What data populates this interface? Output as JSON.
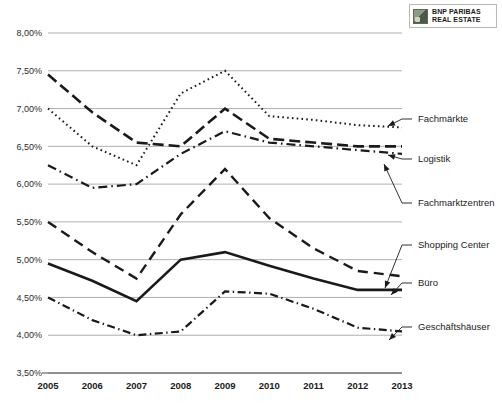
{
  "logo": {
    "line1": "BNP PARIBAS",
    "line2": "REAL ESTATE",
    "mark_name": "bnp-paribas-logo-mark",
    "accent": "#5f6a5a"
  },
  "chart_data": {
    "type": "line",
    "title": "",
    "subtitle": "",
    "xlabel": "",
    "ylabel": "",
    "grid": true,
    "legend_position": "right-inline-callouts",
    "categories": [
      "2005",
      "2006",
      "2007",
      "2008",
      "2009",
      "2010",
      "2011",
      "2012",
      "2013"
    ],
    "x": [
      2005,
      2006,
      2007,
      2008,
      2009,
      2010,
      2011,
      2012,
      2013
    ],
    "ylim": [
      3.5,
      8.0
    ],
    "ytick_values": [
      3.5,
      4.0,
      4.5,
      5.0,
      5.5,
      6.0,
      6.5,
      7.0,
      7.5,
      8.0
    ],
    "ytick_labels": [
      "3,50%",
      "4,00%",
      "4,50%",
      "5,00%",
      "5,50%",
      "6,00%",
      "6,50%",
      "7,00%",
      "7,50%",
      "8,00%"
    ],
    "unit": "%",
    "decimal_separator": ",",
    "series": [
      {
        "name": "Fachmärkte",
        "style": "dotted",
        "dash": "1.6,3.2",
        "width": 2.0,
        "color": "#1a1a1a",
        "values": [
          7.0,
          6.5,
          6.25,
          7.2,
          7.5,
          6.9,
          6.85,
          6.78,
          6.75
        ]
      },
      {
        "name": "Logistik",
        "style": "dashed",
        "dash": "11,5",
        "width": 2.6,
        "color": "#1a1a1a",
        "values": [
          7.45,
          6.95,
          6.55,
          6.5,
          7.0,
          6.6,
          6.55,
          6.5,
          6.5
        ]
      },
      {
        "name": "Fachmarktzentren",
        "style": "dash-dot",
        "dash": "9,4,1.6,4",
        "width": 2.2,
        "color": "#1a1a1a",
        "values": [
          6.25,
          5.95,
          6.0,
          6.4,
          6.7,
          6.55,
          6.5,
          6.45,
          6.4
        ]
      },
      {
        "name": "Shopping Center",
        "style": "long-dashed",
        "dash": "10,6",
        "width": 2.4,
        "color": "#1a1a1a",
        "values": [
          5.5,
          5.1,
          4.75,
          5.6,
          6.2,
          5.55,
          5.15,
          4.85,
          4.78
        ]
      },
      {
        "name": "Büro",
        "style": "solid",
        "dash": "none",
        "width": 2.6,
        "color": "#1a1a1a",
        "values": [
          4.95,
          4.72,
          4.45,
          5.0,
          5.1,
          4.92,
          4.75,
          4.6,
          4.6
        ]
      },
      {
        "name": "Geschäftshäuser",
        "style": "dash-dot",
        "dash": "8,3.5,1.4,3.5",
        "width": 2.2,
        "color": "#1a1a1a",
        "values": [
          4.5,
          4.2,
          4.0,
          4.05,
          4.58,
          4.55,
          4.35,
          4.1,
          4.05
        ]
      }
    ],
    "callouts": [
      {
        "label": "Fachmärkte",
        "series": "Fachmärkte",
        "label_x": 418,
        "label_y": 119,
        "arrow_x": 388,
        "arrow_y": 126
      },
      {
        "label": "Logistik",
        "series": "Logistik",
        "label_x": 418,
        "label_y": 159,
        "arrow_x": 388,
        "arrow_y": 155
      },
      {
        "label": "Fachmarktzentren",
        "series": "Fachmarktzentren",
        "label_x": 418,
        "label_y": 203,
        "arrow_x": 384,
        "arrow_y": 164
      },
      {
        "label": "Shopping Center",
        "series": "Shopping Center",
        "label_x": 418,
        "label_y": 245,
        "arrow_x": 385,
        "arrow_y": 288
      },
      {
        "label": "Büro",
        "series": "Büro",
        "label_x": 418,
        "label_y": 283,
        "arrow_x": 391,
        "arrow_y": 295
      },
      {
        "label": "Geschäftshäuser",
        "series": "Geschäftshäuser",
        "label_x": 418,
        "label_y": 327,
        "arrow_x": 389,
        "arrow_y": 340
      }
    ]
  }
}
